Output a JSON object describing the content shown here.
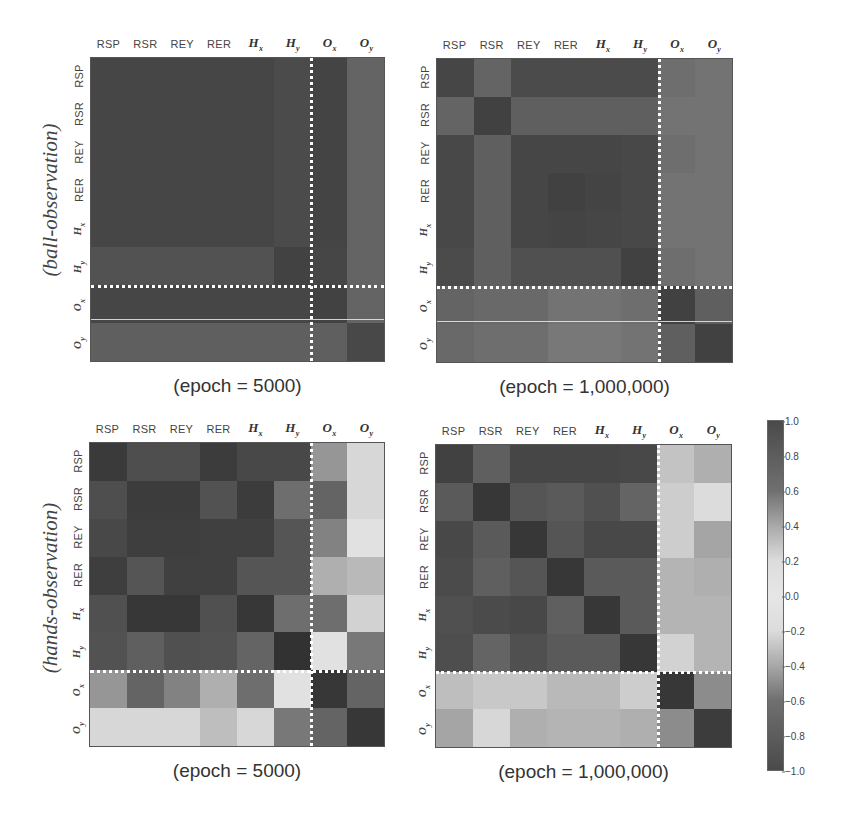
{
  "figure": {
    "side_labels": {
      "top": "(ball-observation)",
      "bottom": "(hands-observation)"
    },
    "labels": {
      "plain": [
        "RSP",
        "RSR",
        "REY",
        "RER"
      ],
      "math": [
        {
          "base": "H",
          "sub": "x"
        },
        {
          "base": "H",
          "sub": "y"
        },
        {
          "base": "O",
          "sub": "x"
        },
        {
          "base": "O",
          "sub": "y"
        }
      ]
    },
    "captions": {
      "top_left": "(epoch = 5000)",
      "top_right": "(epoch = 1,000,000)",
      "bottom_left": "(epoch = 5000)",
      "bottom_right": "(epoch = 1,000,000)"
    },
    "colorbar": {
      "ticks": [
        "1.0",
        "0.8",
        "0.6",
        "0.4",
        "0.2",
        "0.0",
        "−0.2",
        "−0.4",
        "−0.6",
        "−0.8",
        "−1.0"
      ]
    }
  },
  "chart_data": [
    {
      "type": "heatmap",
      "title": "(epoch = 5000)",
      "group": "(ball-observation)",
      "x": [
        "RSP",
        "RSR",
        "REY",
        "RER",
        "H_x",
        "H_y",
        "O_x",
        "O_y"
      ],
      "y": [
        "RSP",
        "RSR",
        "REY",
        "RER",
        "H_x",
        "H_y",
        "O_x",
        "O_y"
      ],
      "vrange": [
        -1.0,
        1.0
      ],
      "separator_after_index": 5,
      "grey": [
        [
          70,
          70,
          70,
          70,
          70,
          75,
          68,
          100
        ],
        [
          70,
          70,
          70,
          70,
          70,
          75,
          68,
          100
        ],
        [
          70,
          70,
          70,
          70,
          70,
          75,
          68,
          100
        ],
        [
          70,
          70,
          70,
          70,
          70,
          75,
          68,
          100
        ],
        [
          70,
          70,
          70,
          70,
          70,
          75,
          68,
          100
        ],
        [
          82,
          82,
          82,
          82,
          82,
          66,
          70,
          100
        ],
        [
          70,
          70,
          70,
          70,
          70,
          70,
          66,
          100
        ],
        [
          95,
          95,
          95,
          95,
          95,
          95,
          95,
          72
        ]
      ],
      "abs_value_estimate": [
        [
          0.85,
          0.85,
          0.85,
          0.85,
          0.85,
          0.82,
          0.86,
          0.65
        ],
        [
          0.85,
          0.85,
          0.85,
          0.85,
          0.85,
          0.82,
          0.86,
          0.65
        ],
        [
          0.85,
          0.85,
          0.85,
          0.85,
          0.85,
          0.82,
          0.86,
          0.65
        ],
        [
          0.85,
          0.85,
          0.85,
          0.85,
          0.85,
          0.82,
          0.86,
          0.65
        ],
        [
          0.85,
          0.85,
          0.85,
          0.85,
          0.85,
          0.82,
          0.86,
          0.65
        ],
        [
          0.78,
          0.78,
          0.78,
          0.78,
          0.78,
          0.88,
          0.85,
          0.65
        ],
        [
          0.85,
          0.85,
          0.85,
          0.85,
          0.85,
          0.85,
          0.88,
          0.65
        ],
        [
          0.68,
          0.68,
          0.68,
          0.68,
          0.68,
          0.68,
          0.68,
          0.84
        ]
      ]
    },
    {
      "type": "heatmap",
      "title": "(epoch = 1,000,000)",
      "group": "(ball-observation)",
      "x": [
        "RSP",
        "RSR",
        "REY",
        "RER",
        "H_x",
        "H_y",
        "O_x",
        "O_y"
      ],
      "y": [
        "RSP",
        "RSR",
        "REY",
        "RER",
        "H_x",
        "H_y",
        "O_x",
        "O_y"
      ],
      "vrange": [
        -1.0,
        1.0
      ],
      "separator_after_index": 5,
      "grey": [
        [
          70,
          100,
          75,
          75,
          75,
          75,
          110,
          115
        ],
        [
          100,
          65,
          95,
          95,
          95,
          95,
          115,
          115
        ],
        [
          72,
          95,
          70,
          70,
          70,
          72,
          110,
          115
        ],
        [
          72,
          95,
          70,
          65,
          68,
          72,
          115,
          115
        ],
        [
          72,
          95,
          70,
          68,
          70,
          72,
          115,
          115
        ],
        [
          75,
          95,
          80,
          80,
          80,
          65,
          110,
          115
        ],
        [
          100,
          105,
          105,
          115,
          115,
          110,
          65,
          95
        ],
        [
          105,
          110,
          110,
          120,
          120,
          115,
          95,
          65
        ]
      ],
      "abs_value_estimate": [
        [
          0.85,
          0.65,
          0.82,
          0.82,
          0.82,
          0.82,
          0.6,
          0.57
        ],
        [
          0.65,
          0.88,
          0.68,
          0.68,
          0.68,
          0.68,
          0.57,
          0.57
        ],
        [
          0.84,
          0.68,
          0.85,
          0.85,
          0.85,
          0.84,
          0.6,
          0.57
        ],
        [
          0.84,
          0.68,
          0.85,
          0.88,
          0.86,
          0.84,
          0.57,
          0.57
        ],
        [
          0.84,
          0.68,
          0.85,
          0.86,
          0.85,
          0.84,
          0.57,
          0.57
        ],
        [
          0.82,
          0.68,
          0.78,
          0.78,
          0.78,
          0.88,
          0.6,
          0.57
        ],
        [
          0.65,
          0.62,
          0.62,
          0.57,
          0.57,
          0.6,
          0.88,
          0.68
        ],
        [
          0.62,
          0.6,
          0.6,
          0.55,
          0.55,
          0.57,
          0.68,
          0.88
        ]
      ]
    },
    {
      "type": "heatmap",
      "title": "(epoch = 5000)",
      "group": "(hands-observation)",
      "x": [
        "RSP",
        "RSR",
        "REY",
        "RER",
        "H_x",
        "H_y",
        "O_x",
        "O_y"
      ],
      "y": [
        "RSP",
        "RSR",
        "REY",
        "RER",
        "H_x",
        "H_y",
        "O_x",
        "O_y"
      ],
      "vrange": [
        -1.0,
        1.0
      ],
      "separator_after_index": 5,
      "grey": [
        [
          58,
          78,
          78,
          60,
          72,
          72,
          150,
          215
        ],
        [
          78,
          60,
          60,
          82,
          60,
          110,
          100,
          215
        ],
        [
          72,
          62,
          62,
          64,
          64,
          85,
          130,
          225
        ],
        [
          62,
          85,
          64,
          64,
          85,
          85,
          175,
          185
        ],
        [
          80,
          55,
          55,
          80,
          55,
          110,
          110,
          210
        ],
        [
          82,
          95,
          80,
          82,
          100,
          50,
          225,
          120
        ],
        [
          150,
          100,
          130,
          175,
          110,
          225,
          55,
          100
        ],
        [
          215,
          215,
          215,
          190,
          215,
          120,
          100,
          55
        ]
      ],
      "abs_value_estimate": [
        [
          0.92,
          0.78,
          0.78,
          0.9,
          0.82,
          0.82,
          0.4,
          0.1
        ],
        [
          0.78,
          0.9,
          0.9,
          0.77,
          0.9,
          0.6,
          0.65,
          0.1
        ],
        [
          0.82,
          0.88,
          0.88,
          0.87,
          0.87,
          0.75,
          0.48,
          0.05
        ],
        [
          0.88,
          0.75,
          0.87,
          0.87,
          0.75,
          0.75,
          0.28,
          0.25
        ],
        [
          0.76,
          0.93,
          0.93,
          0.76,
          0.93,
          0.6,
          0.6,
          0.12
        ],
        [
          0.75,
          0.68,
          0.76,
          0.75,
          0.65,
          0.95,
          0.05,
          0.55
        ],
        [
          0.4,
          0.65,
          0.48,
          0.28,
          0.6,
          0.05,
          0.93,
          0.65
        ],
        [
          0.1,
          0.1,
          0.1,
          0.22,
          0.1,
          0.55,
          0.65,
          0.93
        ]
      ]
    },
    {
      "type": "heatmap",
      "title": "(epoch = 1,000,000)",
      "group": "(hands-observation)",
      "x": [
        "RSP",
        "RSR",
        "REY",
        "RER",
        "H_x",
        "H_y",
        "O_x",
        "O_y"
      ],
      "y": [
        "RSP",
        "RSR",
        "REY",
        "RER",
        "H_x",
        "H_y",
        "O_x",
        "O_y"
      ],
      "vrange": [
        -1.0,
        1.0
      ],
      "separator_after_index": 5,
      "grey": [
        [
          65,
          95,
          70,
          70,
          70,
          72,
          195,
          175
        ],
        [
          90,
          55,
          85,
          90,
          80,
          100,
          205,
          220
        ],
        [
          72,
          90,
          55,
          85,
          72,
          72,
          205,
          165
        ],
        [
          75,
          95,
          85,
          55,
          90,
          90,
          180,
          175
        ],
        [
          80,
          75,
          72,
          95,
          55,
          90,
          180,
          180
        ],
        [
          78,
          100,
          80,
          90,
          90,
          55,
          210,
          180
        ],
        [
          190,
          200,
          200,
          185,
          185,
          205,
          55,
          140
        ],
        [
          165,
          215,
          175,
          180,
          180,
          175,
          140,
          60
        ]
      ],
      "abs_value_estimate": [
        [
          0.88,
          0.68,
          0.85,
          0.85,
          0.85,
          0.84,
          0.18,
          0.28
        ],
        [
          0.7,
          0.93,
          0.73,
          0.7,
          0.78,
          0.65,
          0.15,
          0.08
        ],
        [
          0.84,
          0.7,
          0.93,
          0.73,
          0.84,
          0.84,
          0.15,
          0.32
        ],
        [
          0.83,
          0.68,
          0.73,
          0.93,
          0.7,
          0.7,
          0.26,
          0.28
        ],
        [
          0.78,
          0.83,
          0.84,
          0.68,
          0.93,
          0.7,
          0.26,
          0.26
        ],
        [
          0.8,
          0.65,
          0.78,
          0.7,
          0.7,
          0.93,
          0.12,
          0.26
        ],
        [
          0.2,
          0.15,
          0.15,
          0.24,
          0.24,
          0.14,
          0.93,
          0.45
        ],
        [
          0.32,
          0.1,
          0.28,
          0.26,
          0.26,
          0.28,
          0.45,
          0.9
        ]
      ]
    }
  ]
}
